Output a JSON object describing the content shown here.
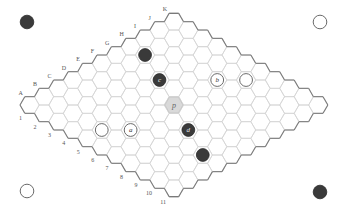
{
  "game": "Hex",
  "board": {
    "size": 11,
    "letters": [
      "A",
      "B",
      "C",
      "D",
      "E",
      "F",
      "G",
      "H",
      "I",
      "J",
      "K"
    ],
    "numbers": [
      "1",
      "2",
      "3",
      "4",
      "5",
      "6",
      "7",
      "8",
      "9",
      "10",
      "11"
    ],
    "colors": {
      "grid": "#d4d4d4",
      "edge": "#7a7a7a",
      "black": "#3a3a3a",
      "white": "#ffffff",
      "highlight": "#d9d9d9"
    }
  },
  "stones": [
    {
      "cell": "H2",
      "color": "black",
      "label": ""
    },
    {
      "cell": "G4",
      "color": "black",
      "label": "c"
    },
    {
      "cell": "E8",
      "color": "black",
      "label": "d"
    },
    {
      "cell": "D10",
      "color": "black",
      "label": ""
    },
    {
      "cell": "I6",
      "color": "white",
      "label": "b"
    },
    {
      "cell": "J7",
      "color": "white",
      "label": ""
    },
    {
      "cell": "C6",
      "color": "white",
      "label": "a"
    },
    {
      "cell": "B5",
      "color": "white",
      "label": ""
    }
  ],
  "highlight": {
    "cell": "F6",
    "label": "p"
  },
  "corner_stones": [
    {
      "position": "top-left",
      "color": "black",
      "x": 27,
      "y": 22
    },
    {
      "position": "top-right",
      "color": "white",
      "x": 320,
      "y": 22
    },
    {
      "position": "bottom-left",
      "color": "white",
      "x": 27,
      "y": 191
    },
    {
      "position": "bottom-right",
      "color": "black",
      "x": 320,
      "y": 192
    }
  ]
}
